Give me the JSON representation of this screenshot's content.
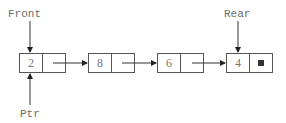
{
  "diagram": {
    "type": "linked-list-queue",
    "labels": {
      "front": "Front",
      "rear": "Rear",
      "ptr": "Ptr"
    },
    "nodes": [
      {
        "value": "2",
        "next": "node-2"
      },
      {
        "value": "8",
        "next": "node-3"
      },
      {
        "value": "6",
        "next": "node-4"
      },
      {
        "value": "4",
        "next": "null"
      }
    ],
    "null_marker": "■",
    "colors": {
      "stroke": "#555555",
      "arrow": "#333333",
      "text": "#6b6b6b",
      "null_fill": "#333333"
    }
  }
}
